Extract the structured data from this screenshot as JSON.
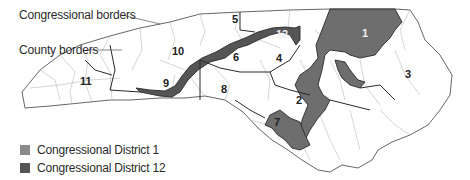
{
  "callouts": {
    "congressional_borders": "Congressional borders",
    "county_borders": "County borders"
  },
  "legend": {
    "items": [
      {
        "label": "Congressional District 1",
        "color": "#8a8a8a"
      },
      {
        "label": "Congressional District 12",
        "color": "#555555"
      }
    ]
  },
  "map": {
    "region": "North Carolina",
    "district_labels": [
      "1",
      "2",
      "3",
      "4",
      "5",
      "6",
      "7",
      "8",
      "9",
      "10",
      "11",
      "12"
    ],
    "colors": {
      "district_1_fill": "#6e6e6e",
      "district_12_fill": "#555555",
      "background_fill": "#ffffff",
      "congressional_border": "#2a2a2a",
      "county_border": "#b5b5b5"
    }
  }
}
